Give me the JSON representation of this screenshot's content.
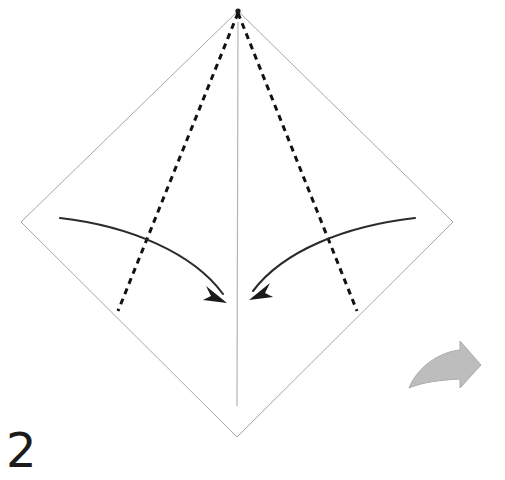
{
  "diagram": {
    "step_number": "2",
    "canvas": {
      "width": 505,
      "height": 480,
      "background": "#ffffff"
    },
    "colors": {
      "paper_edge": "#a8a8a8",
      "center_crease": "#b4b4b4",
      "fold_line_dashed": "#111111",
      "motion_arrow": "#2b2b2b",
      "next_step_arrow_fill": "#bdbdbd",
      "next_step_arrow_stroke": "#ababab",
      "step_number_color": "#1b1b1b"
    },
    "paper": {
      "shape_name": "diamond",
      "vertices": {
        "top": {
          "x": 238,
          "y": 11
        },
        "right": {
          "x": 453,
          "y": 222
        },
        "bottom": {
          "x": 237,
          "y": 437
        },
        "left": {
          "x": 21,
          "y": 222
        }
      },
      "stroke_width": 1
    },
    "center_crease": {
      "label": "vertical center crease",
      "from": {
        "x": 238,
        "y": 22
      },
      "to": {
        "x": 237,
        "y": 406
      },
      "style": "solid",
      "stroke_width": 1.2
    },
    "fold_lines": [
      {
        "name": "left-fold-line",
        "from": {
          "x": 238,
          "y": 13
        },
        "to": {
          "x": 118,
          "y": 311
        },
        "style": "dashed",
        "dash": "6 5",
        "stroke_width": 3
      },
      {
        "name": "right-fold-line",
        "from": {
          "x": 238,
          "y": 13
        },
        "to": {
          "x": 357,
          "y": 311
        },
        "style": "dashed",
        "dash": "6 5",
        "stroke_width": 3
      }
    ],
    "motion_arrows": [
      {
        "name": "left-fold-arrow",
        "direction": "left edge folds to center",
        "path": "M 60 218 C 130 226 195 255 226 299",
        "tip": {
          "x": 227,
          "y": 302
        },
        "stroke_width": 2.1
      },
      {
        "name": "right-fold-arrow",
        "direction": "right edge folds to center",
        "path": "M 415 218 C 345 226 282 253 251 294",
        "tip": {
          "x": 249,
          "y": 298
        },
        "stroke_width": 2.1
      }
    ],
    "next_step_arrow": {
      "name": "next-step-arrow",
      "direction": "right",
      "bounds": {
        "x": 408,
        "y": 341,
        "width": 72,
        "height": 50
      }
    },
    "apex_dot": {
      "x": 238,
      "y": 11,
      "radius": 2.6
    }
  }
}
